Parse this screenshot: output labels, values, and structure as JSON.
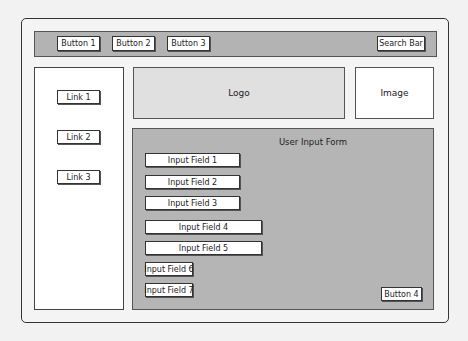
{
  "navbar": {
    "buttons": [
      "Button 1",
      "Button 2",
      "Button 3"
    ],
    "search": "Search Bar"
  },
  "sidebar": {
    "links": [
      "Link 1",
      "Link 2",
      "Link 3"
    ]
  },
  "header": {
    "logo": "Logo",
    "image": "Image"
  },
  "form": {
    "title": "User Input Form",
    "fields": [
      "Input Field 1",
      "Input Field 2",
      "Input Field 3",
      "Input Field 4",
      "Input Field 5",
      "Input Field 6",
      "Input Field 7"
    ],
    "submit": "Button 4"
  },
  "colors": {
    "navbar_bg": "#b3b3b3",
    "form_bg": "#b5b5b5",
    "logo_bg": "#e0e0e0"
  }
}
